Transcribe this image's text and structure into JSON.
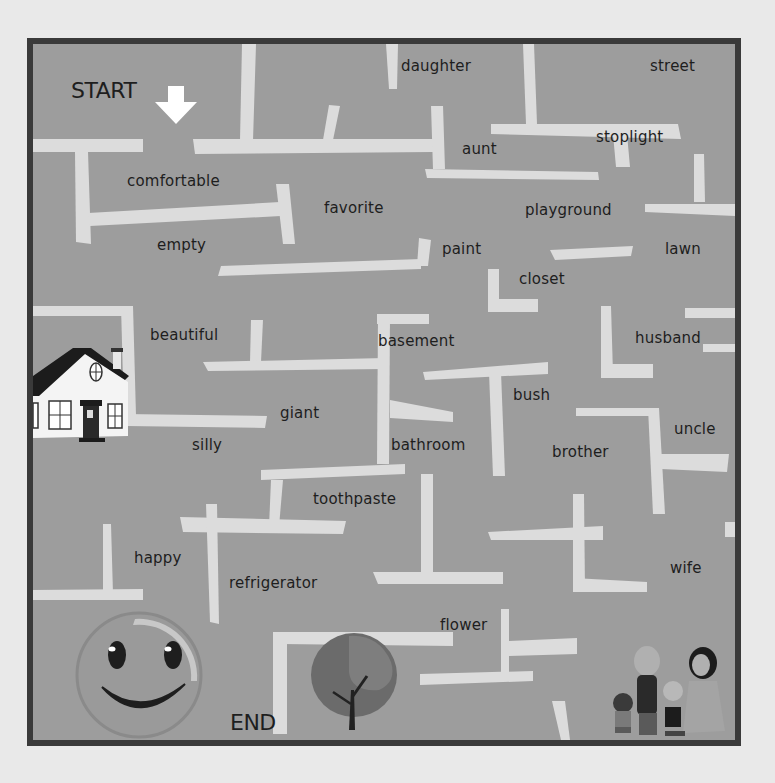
{
  "game": {
    "type": "vocabulary maze",
    "start_label": "START",
    "end_label": "END",
    "colors": {
      "board": "#9d9d9d",
      "walls": "#dcdcdc",
      "border": "#3a3a3a",
      "page": "#e9e9e9",
      "text": "#1e1e1e"
    },
    "words": [
      {
        "id": "daughter",
        "text": "daughter"
      },
      {
        "id": "street",
        "text": "street"
      },
      {
        "id": "aunt",
        "text": "aunt"
      },
      {
        "id": "stoplight",
        "text": "stoplight"
      },
      {
        "id": "comfortable",
        "text": "comfortable"
      },
      {
        "id": "favorite",
        "text": "favorite"
      },
      {
        "id": "playground",
        "text": "playground"
      },
      {
        "id": "empty",
        "text": "empty"
      },
      {
        "id": "paint",
        "text": "paint"
      },
      {
        "id": "lawn",
        "text": "lawn"
      },
      {
        "id": "closet",
        "text": "closet"
      },
      {
        "id": "beautiful",
        "text": "beautiful"
      },
      {
        "id": "basement",
        "text": "basement"
      },
      {
        "id": "husband",
        "text": "husband"
      },
      {
        "id": "bush",
        "text": "bush"
      },
      {
        "id": "giant",
        "text": "giant"
      },
      {
        "id": "silly",
        "text": "silly"
      },
      {
        "id": "bathroom",
        "text": "bathroom"
      },
      {
        "id": "brother",
        "text": "brother"
      },
      {
        "id": "uncle",
        "text": "uncle"
      },
      {
        "id": "toothpaste",
        "text": "toothpaste"
      },
      {
        "id": "happy",
        "text": "happy"
      },
      {
        "id": "refrigerator",
        "text": "refrigerator"
      },
      {
        "id": "wife",
        "text": "wife"
      },
      {
        "id": "flower",
        "text": "flower"
      }
    ],
    "pictures": [
      "arrow-down-icon",
      "house-icon",
      "smiley-face-icon",
      "tree-icon",
      "family-icon"
    ]
  }
}
